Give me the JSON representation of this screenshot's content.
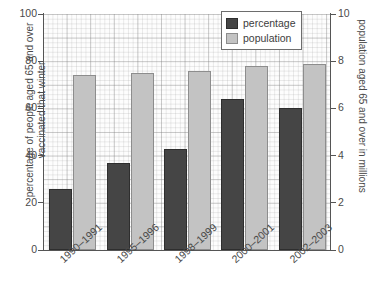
{
  "chart_data": {
    "type": "bar",
    "title": "",
    "categories": [
      "1990–1991",
      "1995–1996",
      "1998–1999",
      "2000–2001",
      "2002–2003"
    ],
    "series": [
      {
        "name": "percentage",
        "axis": "left",
        "color": "#454545",
        "values": [
          26,
          37,
          43,
          64,
          60
        ]
      },
      {
        "name": "population",
        "axis": "right",
        "color": "#c3c3c3",
        "values": [
          7.4,
          7.5,
          7.6,
          7.8,
          7.9
        ]
      }
    ],
    "xlabel": "",
    "ylabel": "percentage of people aged 65 and over vaccinated that winter",
    "ylabel_right": "population aged 65 and over in millions",
    "ylim": [
      0,
      100
    ],
    "ylim_right": [
      0,
      10
    ],
    "yticks": [
      0,
      20,
      40,
      60,
      80,
      100
    ],
    "yticks_right": [
      0,
      2,
      4,
      6,
      8,
      10
    ],
    "grid": true,
    "legend_position": "top-right"
  },
  "legend": {
    "items": [
      {
        "label": "percentage",
        "color": "#454545"
      },
      {
        "label": "population",
        "color": "#c3c3c3"
      }
    ]
  },
  "axes": {
    "left_title": "percentage of people aged 65 and over vaccinated that winter",
    "right_title": "population aged 65 and over in millions",
    "left_ticks": [
      "100",
      "80",
      "60",
      "40",
      "20",
      "0"
    ],
    "right_ticks": [
      "10",
      "8",
      "6",
      "4",
      "2",
      "0"
    ]
  },
  "xaxis": {
    "labels": [
      "1990–1991",
      "1995–1996",
      "1998–1999",
      "2000–2001",
      "2002–2003"
    ]
  }
}
